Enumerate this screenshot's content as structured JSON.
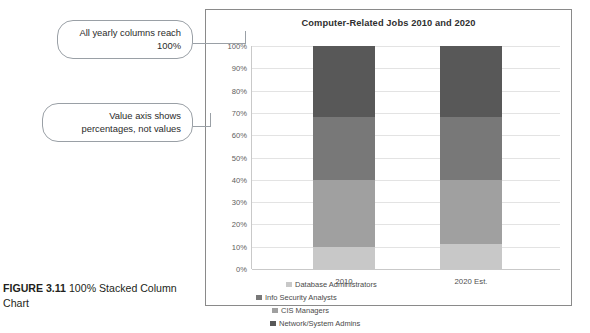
{
  "figure": {
    "label": "FIGURE 3.11",
    "caption": "100% Stacked Column Chart"
  },
  "callouts": [
    {
      "id": "callout-1",
      "text": "All yearly columns reach 100%"
    },
    {
      "id": "callout-2",
      "text": "Value axis shows percentages, not values"
    }
  ],
  "chart_data": {
    "type": "bar",
    "variant": "100% stacked column",
    "title": "Computer-Related Jobs 2010 and 2020",
    "xlabel": "",
    "ylabel": "",
    "categories": [
      "2010",
      "2020 Est."
    ],
    "ylim": [
      0,
      100
    ],
    "ytick_labels": [
      "100%",
      "90%",
      "80%",
      "70%",
      "60%",
      "50%",
      "40%",
      "30%",
      "20%",
      "10%",
      "0%"
    ],
    "ytick_values": [
      100,
      90,
      80,
      70,
      60,
      50,
      40,
      30,
      20,
      10,
      0
    ],
    "grid": true,
    "legend_position": "bottom",
    "series": [
      {
        "name": "Database Administrators",
        "values": [
          10,
          11
        ],
        "color": "#c8c8c8"
      },
      {
        "name": "CIS Managers",
        "values": [
          30,
          29
        ],
        "color": "#a0a0a0"
      },
      {
        "name": "Info Security Analysts",
        "values": [
          28,
          28
        ],
        "color": "#787878"
      },
      {
        "name": "Network/System Admins",
        "values": [
          32,
          32
        ],
        "color": "#585858"
      }
    ],
    "stack_order_bottom_to_top": [
      "Database Administrators",
      "CIS Managers",
      "Info Security Analysts",
      "Network/System Admins"
    ],
    "legend_entries": [
      "Database Administrators",
      "Info Security Analysts",
      "CIS Managers",
      "Network/System Admins"
    ]
  },
  "colors": {
    "frame_border": "#8a8a8a",
    "gridline": "#e3e3e3",
    "callout_border": "#9aa0a6",
    "text": "#3a3a3a"
  }
}
